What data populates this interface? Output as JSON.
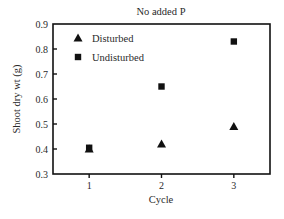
{
  "chart_data": {
    "type": "scatter",
    "title": "No added P",
    "xlabel": "Cycle",
    "ylabel": "Shoot dry wt (g)",
    "x": [
      1,
      2,
      3
    ],
    "xlim": [
      0.5,
      3.5
    ],
    "ylim": [
      0.3,
      0.9
    ],
    "xticks": [
      "1",
      "2",
      "3"
    ],
    "yticks": [
      "0.3",
      "0.4",
      "0.5",
      "0.6",
      "0.7",
      "0.8",
      "0.9"
    ],
    "grid": false,
    "legend_position": "upper-left-inside",
    "series": [
      {
        "name": "Disturbed",
        "marker": "triangle",
        "color": "#111111",
        "values": [
          0.4,
          0.42,
          0.49
        ]
      },
      {
        "name": "Undisturbed",
        "marker": "square",
        "color": "#111111",
        "values": [
          0.405,
          0.65,
          0.83
        ]
      }
    ]
  },
  "layout": {
    "plot_left": 53,
    "plot_right": 270,
    "plot_top": 24,
    "plot_bottom": 174
  }
}
